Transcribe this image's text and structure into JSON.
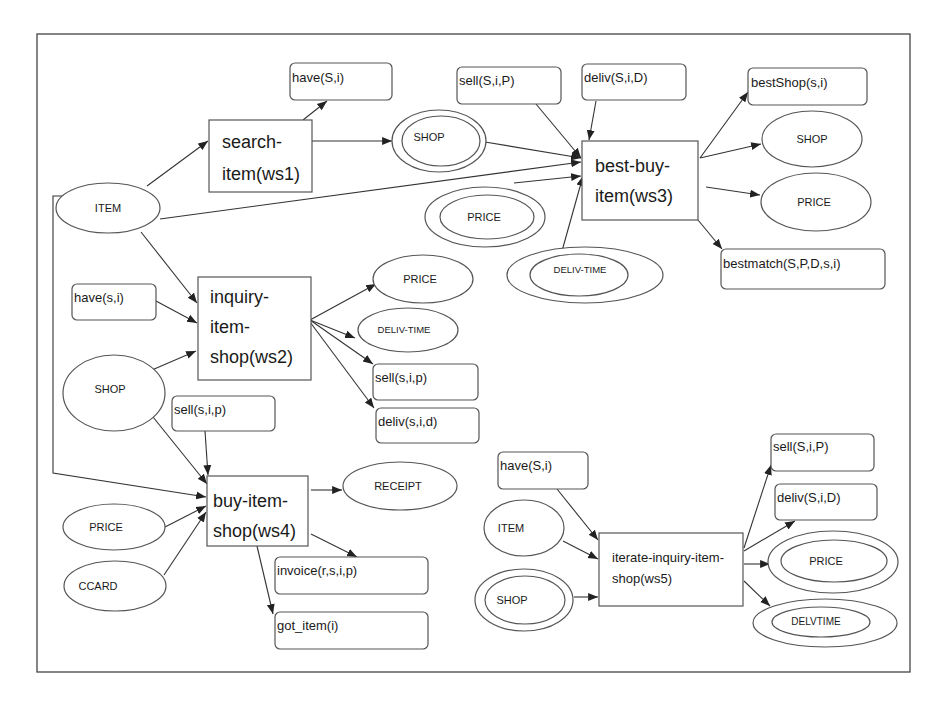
{
  "diagram": {
    "type": "web-service composition graph",
    "services": {
      "ws1": {
        "line1": "search-",
        "line2": "item(ws1)"
      },
      "ws2": {
        "line1": "inquiry-",
        "line2": "item-",
        "line3": "shop(ws2)"
      },
      "ws3": {
        "line1": "best-buy-",
        "line2": "item(ws3)"
      },
      "ws4": {
        "line1": "buy-item-",
        "line2": "shop(ws4)"
      },
      "ws5": {
        "line1": "iterate-inquiry-item-",
        "line2": "shop(ws5)"
      }
    },
    "predicates": {
      "ws1_have": "have(S,i)",
      "ws3_sell": "sell(S,i,P)",
      "ws3_deliv": "deliv(S,i,D)",
      "ws3_bestshop": "bestShop(s,i)",
      "ws3_bestmatch": "bestmatch(S,P,D,s,i)",
      "ws2_have": "have(s,i)",
      "ws2_sell": "sell(s,i,p)",
      "ws2_deliv": "deliv(s,i,d)",
      "ws4_sell": "sell(s,i,p)",
      "ws4_invoice": "invoice(r,s,i,p)",
      "ws4_got": "got_item(i)",
      "ws5_have": "have(S,i)",
      "ws5_sell": "sell(S,i,P)",
      "ws5_deliv": "deliv(S,i,D)"
    },
    "concepts": {
      "item_main": "ITEM",
      "shop_ws1_out": "SHOP",
      "price_ws3_in": "PRICE",
      "delivtime_ws3_in": "DELIV-TIME",
      "shop_ws3_out": "SHOP",
      "price_ws3_out": "PRICE",
      "price_ws2_out": "PRICE",
      "delivtime_ws2_out": "DELIV-TIME",
      "shop_ws2_in": "SHOP",
      "receipt": "RECEIPT",
      "price_ws4_in": "PRICE",
      "ccard": "CCARD",
      "item_ws5": "ITEM",
      "shop_ws5": "SHOP",
      "price_ws5_out": "PRICE",
      "delvtime_ws5_out": "DELVTIME"
    }
  }
}
